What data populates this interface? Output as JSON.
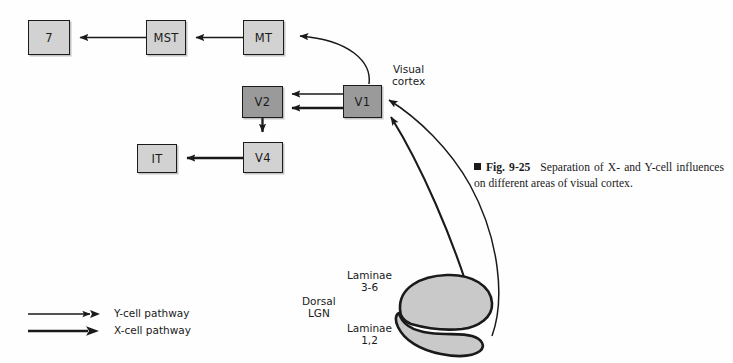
{
  "figure": {
    "marker": "■",
    "number": "Fig. 9-25",
    "caption": "Separation of X- and Y-cell influences on different areas of visual cortex."
  },
  "colors": {
    "box_light": "#d2d2d2",
    "box_dark": "#9a9a9a",
    "lgn_fill": "#c9c9c9",
    "stroke": "#1a1a1a",
    "background": "#fefefe"
  },
  "nodes": [
    {
      "id": "seven",
      "label": "7",
      "shade": "light",
      "x": 28,
      "y": 20,
      "w": 42,
      "h": 35
    },
    {
      "id": "mst",
      "label": "MST",
      "shade": "light",
      "x": 146,
      "y": 20,
      "w": 40,
      "h": 35
    },
    {
      "id": "mt",
      "label": "MT",
      "shade": "light",
      "x": 243,
      "y": 20,
      "w": 41,
      "h": 35
    },
    {
      "id": "v2",
      "label": "V2",
      "shade": "dark",
      "x": 242,
      "y": 86,
      "w": 41,
      "h": 32
    },
    {
      "id": "v1",
      "label": "V1",
      "shade": "dark",
      "x": 343,
      "y": 85,
      "w": 39,
      "h": 33
    },
    {
      "id": "v4",
      "label": "V4",
      "shade": "light",
      "x": 243,
      "y": 142,
      "w": 40,
      "h": 31
    },
    {
      "id": "it",
      "label": "IT",
      "shade": "light",
      "x": 137,
      "y": 144,
      "w": 40,
      "h": 29
    }
  ],
  "labels": {
    "visual_cortex": "Visual\ncortex",
    "dorsal_lgn": "Dorsal\nLGN",
    "laminae_36": "Laminae\n3-6",
    "laminae_12": "Laminae\n1,2"
  },
  "legend": {
    "items": [
      {
        "id": "y-cell",
        "label": "Y-cell pathway",
        "weight": "thin"
      },
      {
        "id": "x-cell",
        "label": "X-cell pathway",
        "weight": "thick"
      }
    ]
  },
  "connections": [
    {
      "id": "mst-to-7",
      "from": "MST",
      "to": "7",
      "type": "straight",
      "pathway": "Y-cell"
    },
    {
      "id": "mt-to-mst",
      "from": "MT",
      "to": "MST",
      "type": "straight",
      "pathway": "Y-cell"
    },
    {
      "id": "v1-to-v2-upper",
      "from": "V1",
      "to": "V2",
      "type": "straight",
      "pathway": "Y-cell"
    },
    {
      "id": "v1-to-v2-lower",
      "from": "V1",
      "to": "V2",
      "type": "straight",
      "pathway": "X-cell"
    },
    {
      "id": "v2-to-v4",
      "from": "V2",
      "to": "V4",
      "type": "straight",
      "pathway": "X-cell"
    },
    {
      "id": "v4-to-it",
      "from": "V4",
      "to": "IT",
      "type": "straight",
      "pathway": "X-cell"
    },
    {
      "id": "v1-to-mt",
      "from": "V1",
      "to": "MT",
      "type": "curve",
      "pathway": "Y-cell"
    },
    {
      "id": "laminae36-to-v1",
      "from": "Laminae 3-6",
      "to": "V1",
      "type": "curve",
      "pathway": "X-cell"
    },
    {
      "id": "laminae12-to-v1",
      "from": "Laminae 1,2",
      "to": "V1",
      "type": "curve",
      "pathway": "Y-cell"
    }
  ]
}
